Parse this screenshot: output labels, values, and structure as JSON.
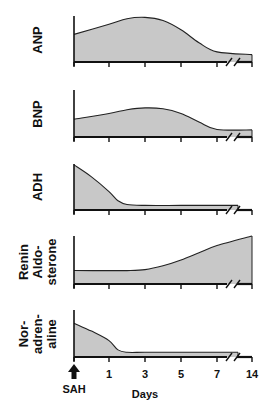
{
  "chart_data": {
    "type": "area",
    "title": "",
    "xlabel": "Days",
    "event_marker": "SAH",
    "x_ticks": [
      "1",
      "3",
      "5",
      "7",
      "14"
    ],
    "axis_break": "between 7 and 14",
    "fill_color": "#c8c8c8",
    "line_color": "#222222",
    "panels": [
      {
        "label": "ANP",
        "label_lines": [
          "ANP"
        ],
        "description": "rises from moderate level at SAH, peaks around day 2-3, declines by day 7, low at day 14",
        "x": [
          0,
          1,
          2,
          3,
          4,
          5,
          6,
          7,
          14
        ],
        "values": [
          0.6,
          0.82,
          0.94,
          0.97,
          0.9,
          0.7,
          0.42,
          0.22,
          0.16
        ]
      },
      {
        "label": "BNP",
        "label_lines": [
          "BNP"
        ],
        "description": "rises from moderate level, peaks around day 3, declines by day 7, low at day 14",
        "x": [
          0,
          1,
          2,
          3,
          4,
          5,
          6,
          7,
          14
        ],
        "values": [
          0.38,
          0.5,
          0.58,
          0.62,
          0.6,
          0.5,
          0.32,
          0.16,
          0.15
        ]
      },
      {
        "label": "ADH",
        "label_lines": [
          "ADH"
        ],
        "description": "high at SAH, falls sharply by day 1.5, low and flat thereafter",
        "x": [
          0,
          0.5,
          1,
          1.5,
          2,
          3,
          5,
          7,
          8
        ],
        "values": [
          0.98,
          0.72,
          0.4,
          0.2,
          0.12,
          0.1,
          0.1,
          0.1,
          0.1
        ]
      },
      {
        "label": "Renin Aldosterone",
        "label_lines": [
          "Renin",
          "Aldo-",
          "sterone"
        ],
        "description": "low and flat until ~day 3, then rises steadily to maximum at day 14",
        "x": [
          0,
          1,
          2,
          3,
          4,
          5,
          6,
          7,
          14
        ],
        "values": [
          0.28,
          0.28,
          0.28,
          0.3,
          0.38,
          0.5,
          0.65,
          0.8,
          1.0
        ]
      },
      {
        "label": "Noradrenaline",
        "label_lines": [
          "Nor-",
          "adren-",
          "aline"
        ],
        "description": "elevated at SAH, declines to low level by day 1.5, flat thereafter",
        "x": [
          0,
          0.5,
          1,
          1.5,
          2,
          3,
          5,
          7,
          8
        ],
        "values": [
          0.72,
          0.55,
          0.35,
          0.15,
          0.1,
          0.1,
          0.1,
          0.1,
          0.1
        ]
      }
    ]
  }
}
